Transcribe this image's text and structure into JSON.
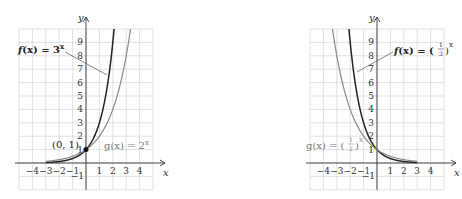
{
  "chart_data": [
    {
      "type": "line",
      "title": "",
      "xlabel": "x",
      "ylabel": "y",
      "xlim": [
        -4.5,
        4.5
      ],
      "ylim": [
        -2,
        10
      ],
      "grid": true,
      "x_ticks": [
        "−4",
        "−3",
        "−2",
        "−1",
        "1",
        "2",
        "3",
        "4"
      ],
      "y_ticks": [
        "−1",
        "1",
        "2",
        "3",
        "4",
        "5",
        "6",
        "7",
        "8",
        "9"
      ],
      "series": [
        {
          "name": "f(x) = 3^x",
          "label_main": "f(x) = 3",
          "label_exp": "x",
          "color": "#222222",
          "base": 3,
          "x": [
            -3,
            -2,
            -1,
            0,
            1,
            2
          ],
          "values": [
            0.037,
            0.111,
            0.333,
            1,
            3,
            9
          ]
        },
        {
          "name": "g(x) = 2^x",
          "label_main": "g(x) = 2",
          "label_exp": "x",
          "color": "#888888",
          "base": 2,
          "x": [
            -3,
            -2,
            -1,
            0,
            1,
            2,
            3
          ],
          "values": [
            0.125,
            0.25,
            0.5,
            1,
            2,
            4,
            8
          ]
        }
      ],
      "annotations": [
        {
          "text": "(0, 1)",
          "x": 0,
          "y": 1
        }
      ]
    },
    {
      "type": "line",
      "title": "",
      "xlabel": "x",
      "ylabel": "y",
      "xlim": [
        -4.5,
        4.5
      ],
      "ylim": [
        -2,
        10
      ],
      "grid": true,
      "x_ticks": [
        "−4",
        "−3",
        "−2",
        "−1",
        "1",
        "2",
        "3",
        "4"
      ],
      "y_ticks": [
        "−1",
        "1",
        "2",
        "3",
        "4",
        "5",
        "6",
        "7",
        "8",
        "9"
      ],
      "series": [
        {
          "name": "f(x) = (1/3)^x",
          "label_main": "f(x) =",
          "label_num": "1",
          "label_den": "3",
          "label_exp": "x",
          "color": "#222222",
          "base": 0.3333,
          "x": [
            -2,
            -1,
            0,
            1,
            2
          ],
          "values": [
            9,
            3,
            1,
            0.333,
            0.111
          ]
        },
        {
          "name": "g(x) = (1/2)^x",
          "label_main": "g(x) =",
          "label_num": "1",
          "label_den": "2",
          "label_exp": "x",
          "color": "#888888",
          "base": 0.5,
          "x": [
            -3,
            -2,
            -1,
            0,
            1,
            2,
            3
          ],
          "values": [
            8,
            4,
            2,
            1,
            0.5,
            0.25,
            0.125
          ]
        }
      ]
    }
  ]
}
